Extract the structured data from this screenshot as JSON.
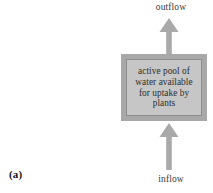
{
  "figure": {
    "panel_label": "(a)",
    "top_flow": {
      "label": "outflow",
      "direction": "up",
      "icon": "arrow-up-icon"
    },
    "bottom_flow": {
      "label": "inflow",
      "direction": "up",
      "icon": "arrow-up-icon"
    },
    "pool": {
      "text": "active pool of water available for uptake by plants",
      "fill_color": "#c9c9c9",
      "border_color": "#a8a8a8"
    },
    "arrow_color": "#a9a9a9",
    "background_color": "#ffffff"
  }
}
